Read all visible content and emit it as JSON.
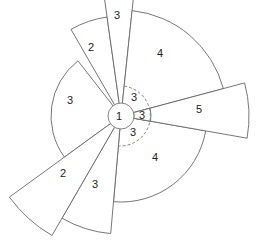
{
  "diagram": {
    "type": "radial-sector-diagram",
    "center_label": "1",
    "sectors": [
      {
        "label": "3",
        "start_deg": -98,
        "end_deg": -84,
        "radius": 130
      },
      {
        "label": "4",
        "start_deg": -84,
        "end_deg": -15,
        "radius": 106
      },
      {
        "label": "5",
        "start_deg": -15,
        "end_deg": 10,
        "radius": 128
      },
      {
        "label": "4",
        "start_deg": 10,
        "end_deg": 95,
        "radius": 86
      },
      {
        "label": "3",
        "start_deg": 95,
        "end_deg": 120,
        "radius": 118
      },
      {
        "label": "2",
        "start_deg": 120,
        "end_deg": 144,
        "radius": 138
      },
      {
        "label": "3",
        "start_deg": 144,
        "end_deg": 232,
        "radius": 70
      },
      {
        "label": "2",
        "start_deg": 232,
        "end_deg": 262,
        "radius": 100
      }
    ],
    "inner_ring": {
      "style": "dashed",
      "radius": 30,
      "segments": [
        {
          "label": "3",
          "start_deg": -84,
          "end_deg": -15
        },
        {
          "label": "3",
          "start_deg": -15,
          "end_deg": 10
        },
        {
          "label": "3",
          "start_deg": 10,
          "end_deg": 95
        }
      ]
    }
  },
  "labels": {
    "top_3": "3",
    "upper_right_4": "4",
    "right_5": "5",
    "lower_right_4": "4",
    "bottom_3": "3",
    "lower_left_2": "2",
    "left_3": "3",
    "upper_left_2": "2",
    "center_1": "1",
    "ring_3_upper": "3",
    "ring_3_middle": "3",
    "ring_3_lower": "3"
  }
}
